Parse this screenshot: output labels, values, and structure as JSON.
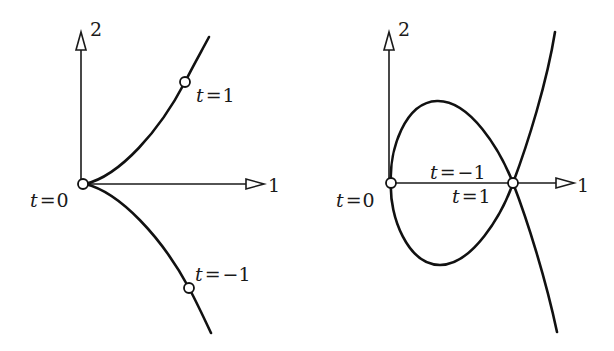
{
  "figure": {
    "left_panel": {
      "name": "cusp",
      "axes": {
        "horizontal_label": "1",
        "vertical_label": "2"
      },
      "points": [
        {
          "label_var": "t",
          "label_eq": "=",
          "label_val": "0",
          "text": "t=0"
        },
        {
          "label_var": "t",
          "label_eq": "=",
          "label_val": "1",
          "text": "t=1"
        },
        {
          "label_var": "t",
          "label_eq": "=",
          "label_val": "−1",
          "text": "t=−1"
        }
      ]
    },
    "right_panel": {
      "name": "node-self-intersection",
      "axes": {
        "horizontal_label": "1",
        "vertical_label": "2"
      },
      "points": [
        {
          "label_var": "t",
          "label_eq": "=",
          "label_val": "0",
          "text": "t=0"
        },
        {
          "label_var": "t",
          "label_eq": "=",
          "label_val": "−1",
          "text": "t=−1"
        },
        {
          "label_var": "t",
          "label_eq": "=",
          "label_val": "1",
          "text": "t=1"
        }
      ]
    }
  }
}
